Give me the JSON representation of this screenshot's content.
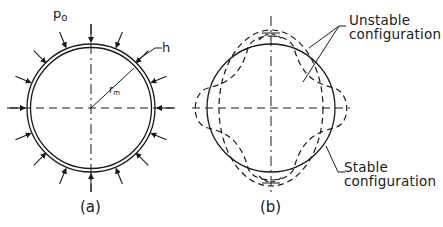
{
  "figure_a": {
    "caption": "(a)",
    "pressure_label": "p",
    "pressure_sub": "o",
    "thickness_label": "h",
    "radius_label": "r",
    "radius_sub": "m"
  },
  "figure_b": {
    "caption": "(b)",
    "unstable_label_line1": "Unstable",
    "unstable_label_line2": "configuration",
    "stable_label_line1": "Stable",
    "stable_label_line2": "configuration"
  },
  "colors": {
    "ink": "#1a1a1a",
    "background": "#ffffff"
  }
}
